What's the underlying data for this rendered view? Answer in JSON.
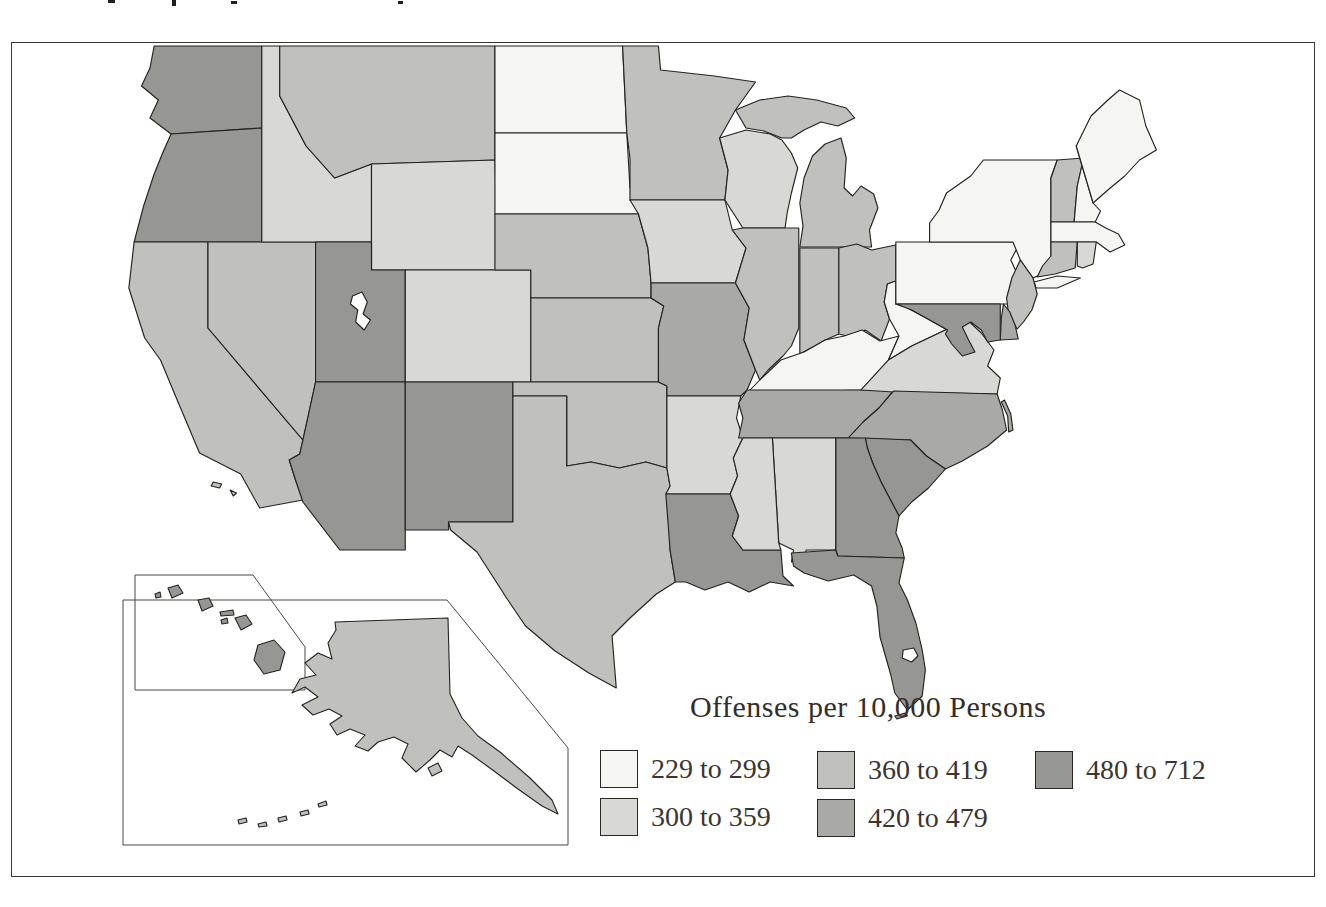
{
  "figure": {
    "type": "choropleth-map",
    "region": "United States",
    "description": "U.S. state choropleth map shaded in five gray classes with Alaska and Hawaii inset boxes at lower left"
  },
  "legend": {
    "title": "Offenses per 10,000 Persons",
    "classes": [
      {
        "label": "229 to 299",
        "color": "#f5f5f1",
        "min": 229,
        "max": 299
      },
      {
        "label": "300 to 359",
        "color": "#d8d8d4",
        "min": 300,
        "max": 359
      },
      {
        "label": "360 to 419",
        "color": "#c0c0bc",
        "min": 360,
        "max": 419
      },
      {
        "label": "420 to 479",
        "color": "#a9a9a5",
        "min": 420,
        "max": 479
      },
      {
        "label": "480 to 712",
        "color": "#969692",
        "min": 480,
        "max": 712
      }
    ]
  },
  "map": {
    "stroke_color": "#26231f",
    "background_color": "#ffffff",
    "states": [
      {
        "abbr": "WA",
        "name": "Washington",
        "class": 5
      },
      {
        "abbr": "OR",
        "name": "Oregon",
        "class": 5
      },
      {
        "abbr": "CA",
        "name": "California",
        "class": 3
      },
      {
        "abbr": "NV",
        "name": "Nevada",
        "class": 3
      },
      {
        "abbr": "ID",
        "name": "Idaho",
        "class": 2
      },
      {
        "abbr": "MT",
        "name": "Montana",
        "class": 3
      },
      {
        "abbr": "WY",
        "name": "Wyoming",
        "class": 2
      },
      {
        "abbr": "UT",
        "name": "Utah",
        "class": 5
      },
      {
        "abbr": "CO",
        "name": "Colorado",
        "class": 2
      },
      {
        "abbr": "AZ",
        "name": "Arizona",
        "class": 5
      },
      {
        "abbr": "NM",
        "name": "New Mexico",
        "class": 5
      },
      {
        "abbr": "ND",
        "name": "North Dakota",
        "class": 1
      },
      {
        "abbr": "SD",
        "name": "South Dakota",
        "class": 1
      },
      {
        "abbr": "NE",
        "name": "Nebraska",
        "class": 3
      },
      {
        "abbr": "KS",
        "name": "Kansas",
        "class": 3
      },
      {
        "abbr": "OK",
        "name": "Oklahoma",
        "class": 3
      },
      {
        "abbr": "TX",
        "name": "Texas",
        "class": 3
      },
      {
        "abbr": "MN",
        "name": "Minnesota",
        "class": 3
      },
      {
        "abbr": "IA",
        "name": "Iowa",
        "class": 2
      },
      {
        "abbr": "MO",
        "name": "Missouri",
        "class": 4
      },
      {
        "abbr": "AR",
        "name": "Arkansas",
        "class": 2
      },
      {
        "abbr": "LA",
        "name": "Louisiana",
        "class": 5
      },
      {
        "abbr": "WI",
        "name": "Wisconsin",
        "class": 2
      },
      {
        "abbr": "IL",
        "name": "Illinois",
        "class": 3
      },
      {
        "abbr": "MI",
        "name": "Michigan",
        "class": 3
      },
      {
        "abbr": "IN",
        "name": "Indiana",
        "class": 3
      },
      {
        "abbr": "OH",
        "name": "Ohio",
        "class": 3
      },
      {
        "abbr": "KY",
        "name": "Kentucky",
        "class": 1
      },
      {
        "abbr": "TN",
        "name": "Tennessee",
        "class": 4
      },
      {
        "abbr": "MS",
        "name": "Mississippi",
        "class": 2
      },
      {
        "abbr": "AL",
        "name": "Alabama",
        "class": 2
      },
      {
        "abbr": "GA",
        "name": "Georgia",
        "class": 5
      },
      {
        "abbr": "FL",
        "name": "Florida",
        "class": 5
      },
      {
        "abbr": "SC",
        "name": "South Carolina",
        "class": 5
      },
      {
        "abbr": "NC",
        "name": "North Carolina",
        "class": 4
      },
      {
        "abbr": "VA",
        "name": "Virginia",
        "class": 2
      },
      {
        "abbr": "WV",
        "name": "West Virginia",
        "class": 1
      },
      {
        "abbr": "MD",
        "name": "Maryland",
        "class": 5
      },
      {
        "abbr": "DE",
        "name": "Delaware",
        "class": 4
      },
      {
        "abbr": "NJ",
        "name": "New Jersey",
        "class": 3
      },
      {
        "abbr": "PA",
        "name": "Pennsylvania",
        "class": 1
      },
      {
        "abbr": "NY",
        "name": "New York",
        "class": 1
      },
      {
        "abbr": "CT",
        "name": "Connecticut",
        "class": 3
      },
      {
        "abbr": "RI",
        "name": "Rhode Island",
        "class": 2
      },
      {
        "abbr": "MA",
        "name": "Massachusetts",
        "class": 1
      },
      {
        "abbr": "VT",
        "name": "Vermont",
        "class": 3
      },
      {
        "abbr": "NH",
        "name": "New Hampshire",
        "class": 1
      },
      {
        "abbr": "ME",
        "name": "Maine",
        "class": 1
      },
      {
        "abbr": "AK",
        "name": "Alaska",
        "class": 3
      },
      {
        "abbr": "HI",
        "name": "Hawaii",
        "class": 5
      }
    ]
  }
}
